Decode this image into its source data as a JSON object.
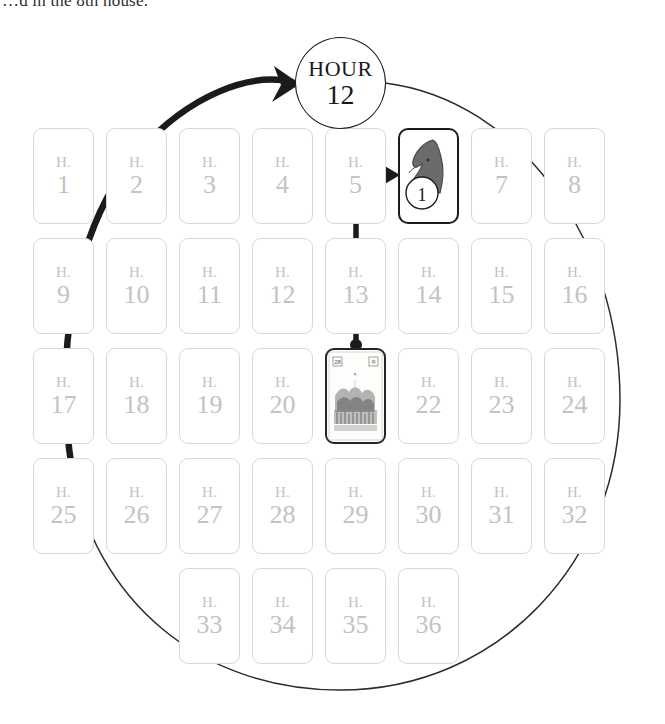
{
  "caption": {
    "text": "…d in the 8th house."
  },
  "hour_marker": {
    "label": "HOUR",
    "value": "12"
  },
  "grid": {
    "house_prefix": "H.",
    "rows": [
      {
        "start_col": 0,
        "cells": [
          {
            "type": "house",
            "number": "1"
          },
          {
            "type": "house",
            "number": "2"
          },
          {
            "type": "house",
            "number": "3"
          },
          {
            "type": "house",
            "number": "4"
          },
          {
            "type": "house",
            "number": "5"
          },
          {
            "type": "knight",
            "number": "6",
            "badge": "1"
          },
          {
            "type": "house",
            "number": "7"
          },
          {
            "type": "house",
            "number": "8"
          }
        ]
      },
      {
        "start_col": 0,
        "cells": [
          {
            "type": "house",
            "number": "9"
          },
          {
            "type": "house",
            "number": "10"
          },
          {
            "type": "house",
            "number": "11"
          },
          {
            "type": "house",
            "number": "12"
          },
          {
            "type": "house",
            "number": "13"
          },
          {
            "type": "house",
            "number": "14"
          },
          {
            "type": "house",
            "number": "15"
          },
          {
            "type": "house",
            "number": "16"
          }
        ]
      },
      {
        "start_col": 0,
        "cells": [
          {
            "type": "house",
            "number": "17"
          },
          {
            "type": "house",
            "number": "18"
          },
          {
            "type": "house",
            "number": "19"
          },
          {
            "type": "house",
            "number": "20"
          },
          {
            "type": "picture",
            "number": "21"
          },
          {
            "type": "house",
            "number": "22"
          },
          {
            "type": "house",
            "number": "23"
          },
          {
            "type": "house",
            "number": "24"
          }
        ]
      },
      {
        "start_col": 0,
        "cells": [
          {
            "type": "house",
            "number": "25"
          },
          {
            "type": "house",
            "number": "26"
          },
          {
            "type": "house",
            "number": "27"
          },
          {
            "type": "house",
            "number": "28"
          },
          {
            "type": "house",
            "number": "29"
          },
          {
            "type": "house",
            "number": "30"
          },
          {
            "type": "house",
            "number": "31"
          },
          {
            "type": "house",
            "number": "32"
          }
        ]
      },
      {
        "start_col": 2,
        "cells": [
          {
            "type": "house",
            "number": "33"
          },
          {
            "type": "house",
            "number": "34"
          },
          {
            "type": "house",
            "number": "35"
          },
          {
            "type": "house",
            "number": "36"
          }
        ]
      }
    ]
  },
  "annotations": {
    "knight_badge": "1",
    "thick_arrow_name": "hour-sweep-arrow",
    "thin_arc_name": "hour-cycle-arc",
    "pointer_arrow_name": "card-to-knight-arrow"
  },
  "colors": {
    "card_outline": "#d8d8d8",
    "card_text": "#c3c3c3",
    "ink": "#1a1a1a",
    "knight_fill": "#6b6b6b",
    "thin_line": "#2b2b2b"
  }
}
